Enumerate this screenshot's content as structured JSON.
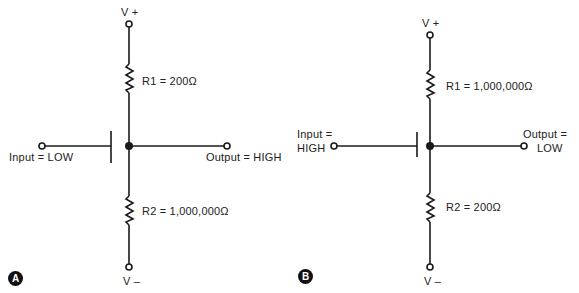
{
  "panels": [
    {
      "id": "A",
      "badge": "A",
      "vplus": "V +",
      "vminus": "V –",
      "r1": "R1  =  200Ω",
      "r2": "R2  =  1,000,000Ω",
      "input": "Input  =  LOW",
      "output": "Output  =  HIGH"
    },
    {
      "id": "B",
      "badge": "B",
      "vplus": "V +",
      "vminus": "V –",
      "r1": "R1  =  1,000,000Ω",
      "r2": "R2  =  200Ω",
      "input_line1": "Input  =",
      "input_line2": "HIGH",
      "output_line1": "Output  =",
      "output_line2": "LOW"
    }
  ],
  "colors": {
    "stroke": "#1a1a1a",
    "background": "#ffffff"
  }
}
